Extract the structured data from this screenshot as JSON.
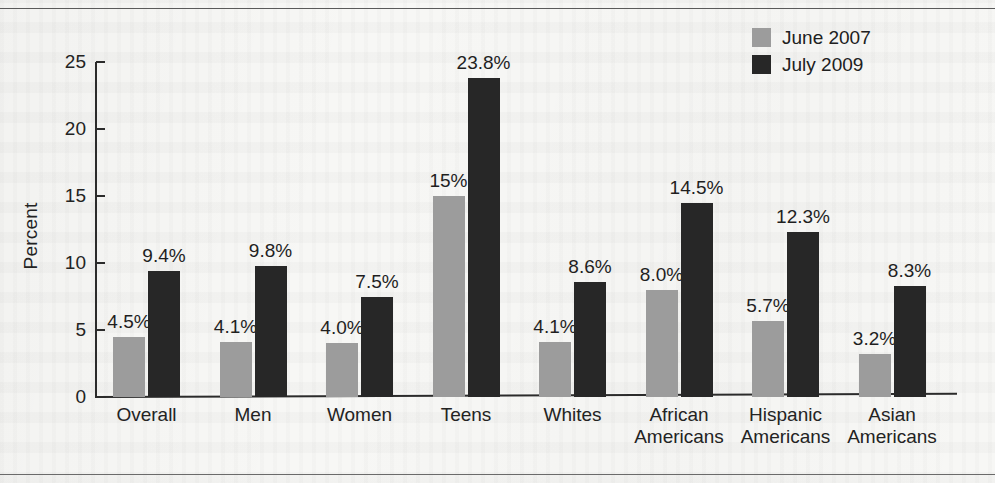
{
  "chart_data": {
    "type": "bar",
    "title": "",
    "xlabel": "",
    "ylabel": "Percent",
    "ylim": [
      0,
      25
    ],
    "yticks": [
      0,
      5,
      10,
      15,
      20,
      25
    ],
    "grid": false,
    "legend_position": "top-right",
    "categories": [
      "Overall",
      "Men",
      "Women",
      "Teens",
      "Whites",
      "African\nAmericans",
      "Hispanic\nAmericans",
      "Asian\nAmericans"
    ],
    "series": [
      {
        "name": "June 2007",
        "color": "#9c9c9c",
        "values": [
          4.5,
          4.1,
          4.0,
          15.0,
          4.1,
          8.0,
          5.7,
          3.2
        ],
        "labels": [
          "4.5%",
          "4.1%",
          "4.0%",
          "15%",
          "4.1%",
          "8.0%",
          "5.7%",
          "3.2%"
        ]
      },
      {
        "name": "July 2009",
        "color": "#272727",
        "values": [
          9.4,
          9.8,
          7.5,
          23.8,
          8.6,
          14.5,
          12.3,
          8.3
        ],
        "labels": [
          "9.4%",
          "9.8%",
          "7.5%",
          "23.8%",
          "8.6%",
          "14.5%",
          "12.3%",
          "8.3%"
        ]
      }
    ]
  },
  "legend": {
    "items": [
      {
        "label": "June 2007",
        "color": "#9c9c9c"
      },
      {
        "label": "July 2009",
        "color": "#272727"
      }
    ]
  },
  "axis": {
    "y_label": "Percent",
    "y_ticks": [
      "25",
      "20",
      "15",
      "10",
      "5",
      "0"
    ]
  }
}
